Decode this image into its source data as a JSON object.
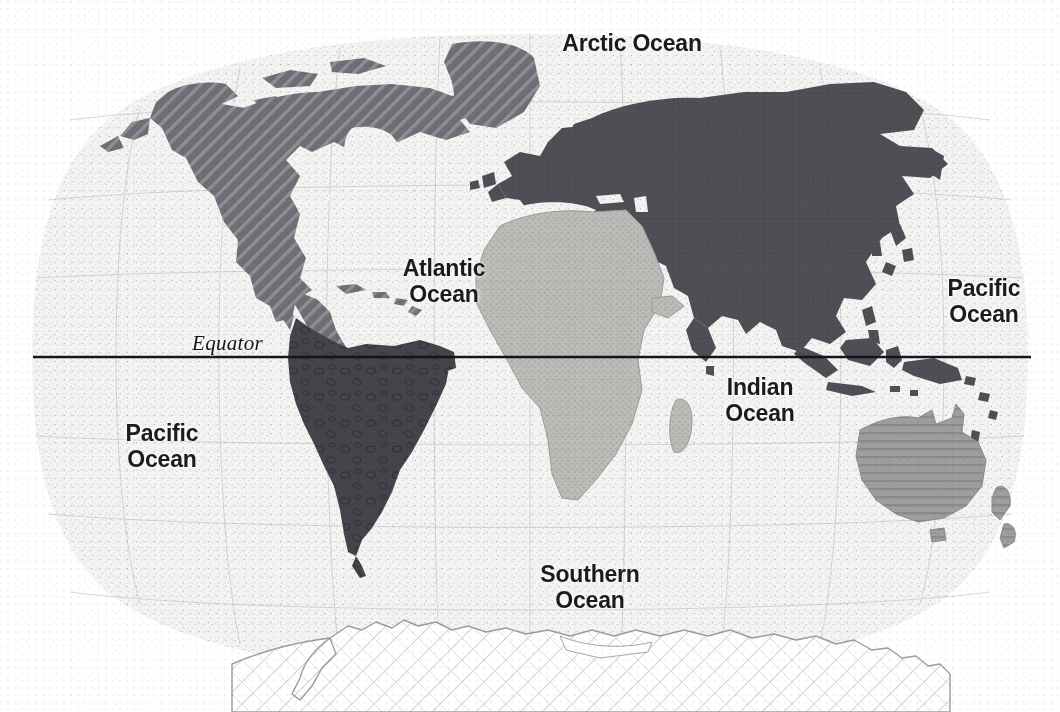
{
  "map": {
    "title": "World Map",
    "projection": "oval pseudocylindrical (Robinson-style) world projection",
    "style": "grayscale halftone print scan",
    "background_color": "#ffffff",
    "ocean_fill_color": "#f3f3f2",
    "ocean_stipple_color": "#8b8c93",
    "graticule_color": "#b9bac1",
    "equator": {
      "label": "Equator",
      "line_color": "#14141a",
      "line_y": 357,
      "line_x_start": 33,
      "line_x_end": 1031,
      "label_x": 192,
      "label_y": 331
    },
    "ocean_labels": [
      {
        "name": "arctic-ocean",
        "text": "Arctic Ocean",
        "x": 527,
        "y": 30,
        "width": 210,
        "align": "center"
      },
      {
        "name": "atlantic-ocean",
        "text": "Atlantic\nOcean",
        "x": 374,
        "y": 255,
        "width": 140,
        "align": "center"
      },
      {
        "name": "pacific-ocean-east",
        "text": "Pacific\nOcean",
        "x": 922,
        "y": 275,
        "width": 124,
        "align": "center"
      },
      {
        "name": "indian-ocean",
        "text": "Indian\nOcean",
        "x": 692,
        "y": 374,
        "width": 136,
        "align": "center"
      },
      {
        "name": "pacific-ocean-west",
        "text": "Pacific\nOcean",
        "x": 100,
        "y": 420,
        "width": 124,
        "align": "center"
      },
      {
        "name": "southern-ocean",
        "text": "Southern\nOcean",
        "x": 500,
        "y": 561,
        "width": 180,
        "align": "center"
      }
    ],
    "landmasses": [
      {
        "name": "north-america",
        "label": "North America",
        "fill": "#6e6f74",
        "pattern": "diagonal-hatch-45"
      },
      {
        "name": "greenland",
        "label": "Greenland",
        "fill": "#6e6f74",
        "pattern": "diagonal-hatch-45"
      },
      {
        "name": "south-america",
        "label": "South America",
        "fill": "#44444a",
        "pattern": "ring-speckle"
      },
      {
        "name": "africa",
        "label": "Africa",
        "fill": "#b9b9b6",
        "pattern": "fine-dot"
      },
      {
        "name": "eurasia",
        "label": "Eurasia",
        "fill": "#4e4f55",
        "pattern": "solid"
      },
      {
        "name": "southeast-asia-islands",
        "label": "Southeast Asia Islands",
        "fill": "#4e4f55",
        "pattern": "solid"
      },
      {
        "name": "australia",
        "label": "Australia",
        "fill": "#9c9d9d",
        "pattern": "horizontal-lines"
      },
      {
        "name": "new-zealand",
        "label": "New Zealand",
        "fill": "#9c9d9d",
        "pattern": "horizontal-lines"
      },
      {
        "name": "antarctica",
        "label": "Antarctica",
        "fill": "#ffffff",
        "pattern": "faint-crosshatch-outline"
      }
    ]
  }
}
